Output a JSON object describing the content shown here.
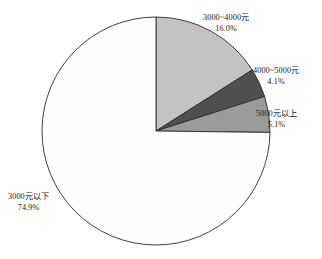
{
  "chart_data": {
    "type": "pie",
    "title": "",
    "subtitle": "",
    "xlabel": "",
    "ylabel": "",
    "legend_position": "none",
    "grid": false,
    "start_angle_deg": 0,
    "direction": "clockwise",
    "center": {
      "x": 156,
      "y": 131
    },
    "radius": 114,
    "categories": [
      "3000~4000元",
      "4000~5000元",
      "5000元以上",
      "3000元以下"
    ],
    "values": [
      16.0,
      4.1,
      5.1,
      74.9
    ],
    "value_labels": [
      "16.0%",
      "4.1%",
      "5.1%",
      "74.9%"
    ],
    "colors": [
      "#c3c3c3",
      "#4f4f4f",
      "#9b9b9b",
      "#fefefe"
    ],
    "slices": [
      {
        "name": "3000~4000元",
        "percent_label": "16.0%",
        "value": 16.0,
        "color": "#c3c3c3",
        "start_deg": 0.0,
        "end_deg": 57.6
      },
      {
        "name": "4000~5000元",
        "percent_label": "4.1%",
        "value": 4.1,
        "color": "#4f4f4f",
        "start_deg": 57.6,
        "end_deg": 72.36
      },
      {
        "name": "5000元以上",
        "percent_label": "5.1%",
        "value": 5.1,
        "color": "#9b9b9b",
        "start_deg": 72.36,
        "end_deg": 90.72
      },
      {
        "name": "3000元以下",
        "percent_label": "74.9%",
        "value": 74.9,
        "color": "#fefefe",
        "start_deg": 90.72,
        "end_deg": 360.0
      }
    ],
    "outline_color": "#2b2b2b",
    "background": "#ffffff"
  }
}
